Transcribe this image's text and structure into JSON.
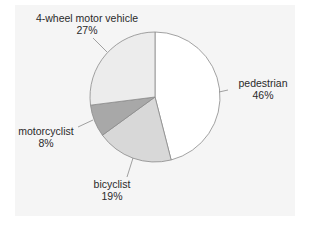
{
  "chart_data": {
    "type": "pie",
    "title": "",
    "categories": [
      "pedestrian",
      "bicyclist",
      "motorcyclist",
      "4-wheel motor vehicle"
    ],
    "values": [
      46,
      19,
      8,
      27
    ],
    "unit": "%",
    "start_angle_deg": 90,
    "direction": "clockwise",
    "colors": [
      "#ffffff",
      "#d8d8d8",
      "#a8a8a8",
      "#ececec"
    ],
    "labels": [
      {
        "name": "pedestrian",
        "pct": "46%"
      },
      {
        "name": "bicyclist",
        "pct": "19%"
      },
      {
        "name": "motorcyclist",
        "pct": "8%"
      },
      {
        "name": "4-wheel motor vehicle",
        "pct": "27%"
      }
    ]
  },
  "style": {
    "panel_bg": "#f5f5f5",
    "slice_stroke": "#8a8a8a",
    "leader_color": "#8a8a8a"
  }
}
